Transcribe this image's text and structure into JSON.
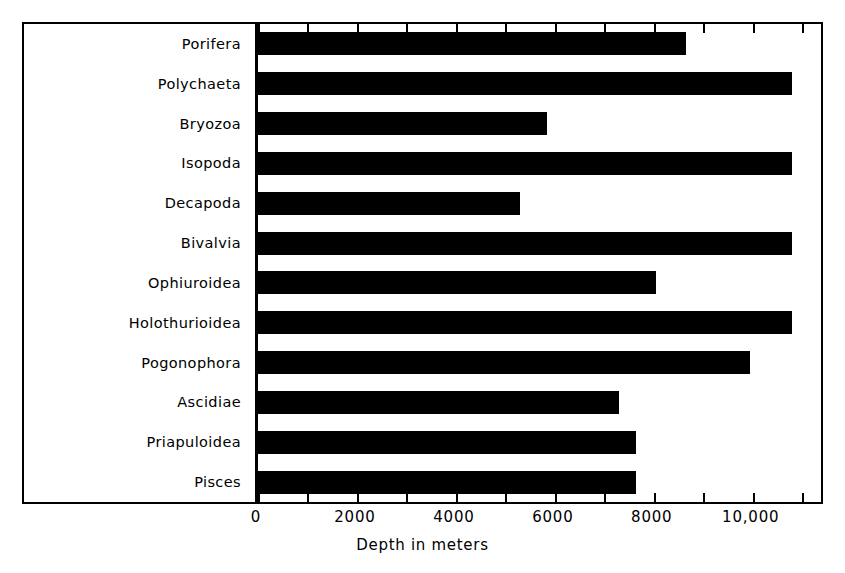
{
  "chart_data": {
    "type": "bar",
    "orientation": "horizontal",
    "title": "",
    "xlabel": "Depth in meters",
    "ylabel": "",
    "categories": [
      "Porifera",
      "Polychaeta",
      "Bryozoa",
      "Isopoda",
      "Decapoda",
      "Bivalvia",
      "Ophiuroidea",
      "Holothurioidea",
      "Pogonophora",
      "Ascidiae",
      "Priapuloidea",
      "Pisces"
    ],
    "values": [
      8650,
      10800,
      5850,
      10800,
      5300,
      10800,
      8050,
      10800,
      9950,
      7300,
      7650,
      7650
    ],
    "xlim": [
      0,
      11400
    ],
    "xticks": [
      0,
      1000,
      2000,
      3000,
      4000,
      5000,
      6000,
      7000,
      8000,
      9000,
      10000,
      11000
    ],
    "xtick_labels": [
      "0",
      "",
      "2000",
      "",
      "4000",
      "",
      "6000",
      "",
      "8000",
      "",
      "10,000",
      ""
    ],
    "labeled_ticks": [
      {
        "value": 0,
        "label": "0"
      },
      {
        "value": 2000,
        "label": "2000"
      },
      {
        "value": 4000,
        "label": "4000"
      },
      {
        "value": 6000,
        "label": "6000"
      },
      {
        "value": 8000,
        "label": "8000"
      },
      {
        "value": 10000,
        "label": "10,000"
      }
    ],
    "grid": false,
    "legend": null,
    "bar_color": "#000000",
    "background_color": "#ffffff",
    "frame_color": "#000000"
  }
}
